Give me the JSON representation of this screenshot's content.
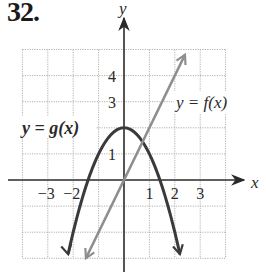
{
  "problem_number": "32.",
  "axes": {
    "x_label": "x",
    "y_label": "y",
    "x_ticks": [
      {
        "value": -3,
        "label": "−3"
      },
      {
        "value": -2,
        "label": "−2"
      },
      {
        "value": 1,
        "label": "1"
      },
      {
        "value": 2,
        "label": "2"
      },
      {
        "value": 3,
        "label": "3"
      }
    ],
    "y_ticks": [
      {
        "value": 1,
        "label": "1"
      },
      {
        "value": 3,
        "label": "3"
      },
      {
        "value": 4,
        "label": "4"
      }
    ]
  },
  "curve_labels": {
    "g": "y = g(x)",
    "f": "y = f(x)"
  },
  "colors": {
    "g_curve": "#3a3a3a",
    "f_curve": "#8e8e8e",
    "axis": "#2a2a2a",
    "grid": "#b0b0b0",
    "f_label": "#9a9a9a"
  },
  "chart_data": {
    "type": "line",
    "title": "32.",
    "xlabel": "x",
    "ylabel": "y",
    "xlim": [
      -4,
      4
    ],
    "ylim": [
      -3,
      5
    ],
    "grid": true,
    "legend": "inline labels",
    "series": [
      {
        "name": "y = g(x)",
        "description": "downward parabola, vertex (0, 2), x-intercepts ≈ ±1.41",
        "x": [
          -2.24,
          -2,
          -1.5,
          -1.41,
          -1,
          -0.5,
          0,
          0.5,
          1,
          1.41,
          1.5,
          2,
          2.24
        ],
        "y": [
          -3,
          -2,
          -0.25,
          0,
          1,
          1.75,
          2,
          1.75,
          1,
          0,
          -0.25,
          -2,
          -3
        ]
      },
      {
        "name": "y = f(x)",
        "description": "line through origin with slope 2",
        "x": [
          -1.5,
          -1,
          0,
          1,
          2,
          2.4
        ],
        "y": [
          -3,
          -2,
          0,
          2,
          4,
          4.8
        ]
      }
    ]
  }
}
